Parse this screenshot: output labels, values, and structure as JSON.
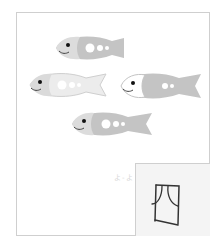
{
  "worksheet": {
    "fish_count": 4,
    "hint_text": "よ-よ",
    "answer_character": "四",
    "colors": {
      "fish_body": "#c4c4c4",
      "fish_head": "#dcdcdc",
      "fish_light_body": "#e2e2e2",
      "frame_border": "#cfcfcf",
      "answer_bg": "#f4f4f4",
      "ink": "#333333"
    },
    "fish": [
      {
        "id": 1,
        "x": 52,
        "y": 33,
        "style": "gray"
      },
      {
        "id": 2,
        "x": 26,
        "y": 70,
        "style": "light"
      },
      {
        "id": 3,
        "x": 117,
        "y": 70,
        "style": "white-head"
      },
      {
        "id": 4,
        "x": 68,
        "y": 109,
        "style": "gray"
      }
    ]
  }
}
